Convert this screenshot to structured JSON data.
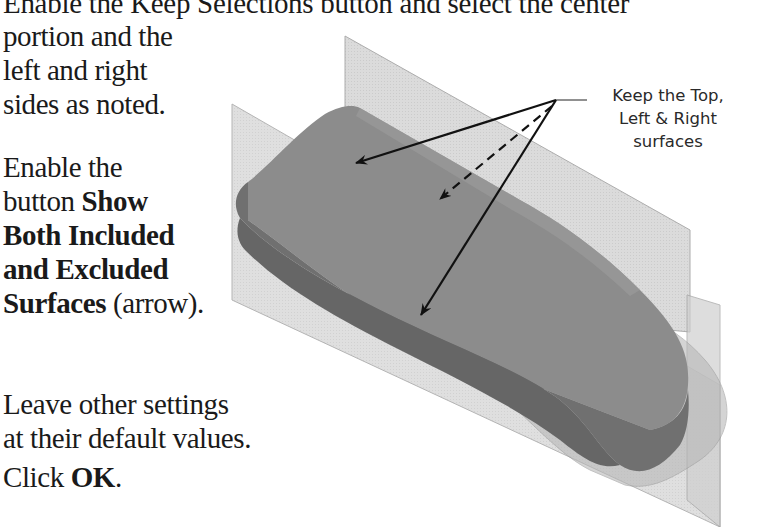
{
  "instructions": {
    "heading_line": "Enable the Keep Selections button and select the center",
    "step1": {
      "lines": [
        "portion and the",
        "left and right",
        "sides as noted."
      ]
    },
    "step2": {
      "line1": "Enable the",
      "line2_prefix": "button ",
      "line2_bold": "Show",
      "line3_bold": "Both Included",
      "line4_bold": "and Excluded",
      "line5_bold": "Surfaces",
      "line5_suffix": " (arrow)."
    },
    "step3": {
      "lines": [
        "Leave other settings",
        "at their default values."
      ]
    },
    "step4": {
      "prefix": "Click ",
      "bold": "OK",
      "suffix": "."
    }
  },
  "figure": {
    "callout": {
      "lines": [
        "Keep the Top,",
        "Left & Right",
        "surfaces"
      ]
    },
    "colors": {
      "plane_fill": "#d6d6d6",
      "plane_edge": "#a8a8a8",
      "body_top": "#8a8a8a",
      "body_side": "#6f6f6f",
      "body_excluded": "#b0b0b0",
      "arrow": "#111111"
    }
  }
}
